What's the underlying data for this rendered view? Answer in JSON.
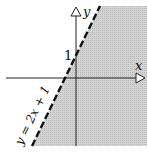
{
  "diagram": {
    "type": "linear-inequality-graph",
    "axes": {
      "x_label": "x",
      "y_label": "y"
    },
    "y_intercept_label": "1",
    "boundary_line": {
      "equation_label": "y = 2x + 1",
      "style": "dashed",
      "slope": 2,
      "intercept": 1
    },
    "shaded_region": "below/right of the line",
    "colors": {
      "shade": "#c8c8c8",
      "line": "#111111",
      "axes": "#222222",
      "background": "#ffffff"
    }
  }
}
